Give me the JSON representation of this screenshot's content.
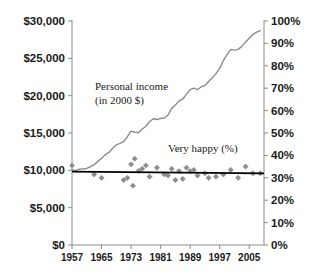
{
  "chart_data": {
    "type": "line",
    "title": "",
    "subtitle": "",
    "xlabel": "",
    "ylabel": "",
    "grid": false,
    "legend_position": "inline-annotations",
    "x": [
      1957,
      1958,
      1959,
      1960,
      1961,
      1962,
      1963,
      1964,
      1965,
      1966,
      1967,
      1968,
      1969,
      1970,
      1971,
      1972,
      1973,
      1974,
      1975,
      1976,
      1977,
      1978,
      1979,
      1980,
      1981,
      1982,
      1983,
      1984,
      1985,
      1986,
      1987,
      1988,
      1989,
      1990,
      1991,
      1992,
      1993,
      1994,
      1995,
      1996,
      1997,
      1998,
      1999,
      2000,
      2001,
      2002,
      2003,
      2004,
      2005,
      2006,
      2007,
      2008
    ],
    "xlim": [
      1957,
      2009
    ],
    "xticks": [
      1957,
      1965,
      1973,
      1981,
      1989,
      1997,
      2005
    ],
    "xticklabels": [
      "1957",
      "1965",
      "1973",
      "1981",
      "1989",
      "1997",
      "2005"
    ],
    "axes": [
      {
        "id": "left",
        "name": "personal-income-axis",
        "ylim": [
          0,
          30000
        ],
        "yticks": [
          0,
          5000,
          10000,
          15000,
          20000,
          25000,
          30000
        ],
        "yticklabels": [
          "$0",
          "$5,000",
          "$10,000",
          "$15,000",
          "$20,000",
          "$25,000",
          "$30,000"
        ]
      },
      {
        "id": "right",
        "name": "very-happy-axis",
        "ylim": [
          0,
          100
        ],
        "yticks": [
          0,
          10,
          20,
          30,
          40,
          50,
          60,
          70,
          80,
          90,
          100
        ],
        "yticklabels": [
          "0%",
          "10%",
          "20%",
          "30%",
          "40%",
          "50%",
          "60%",
          "70%",
          "80%",
          "90%",
          "100%"
        ]
      }
    ],
    "series": [
      {
        "name": "Personal income (in 2000 $)",
        "axis": "left",
        "type": "line",
        "color": "#8c8c8c",
        "values": [
          10100,
          9950,
          10150,
          10200,
          10250,
          10500,
          10750,
          11200,
          11600,
          12100,
          12400,
          12950,
          13400,
          13600,
          13850,
          14500,
          15250,
          15100,
          15050,
          15500,
          15900,
          16500,
          16900,
          16800,
          16950,
          17000,
          17400,
          18300,
          18750,
          19300,
          19550,
          20200,
          20800,
          21000,
          20800,
          21200,
          21350,
          21900,
          22400,
          22950,
          23650,
          24700,
          25500,
          26200,
          26100,
          26200,
          26600,
          27200,
          27700,
          28200,
          28500,
          28700
        ]
      },
      {
        "name": "Very happy (%)",
        "axis": "right",
        "type": "scatter",
        "color": "#8c8c8c",
        "marker": "diamond",
        "points": [
          {
            "x": 1957,
            "y": 35.5
          },
          {
            "x": 1963,
            "y": 31.5
          },
          {
            "x": 1965,
            "y": 30.0
          },
          {
            "x": 1971,
            "y": 29.0
          },
          {
            "x": 1972,
            "y": 30.0
          },
          {
            "x": 1973,
            "y": 36.0
          },
          {
            "x": 1973.5,
            "y": 26.5
          },
          {
            "x": 1974,
            "y": 38.5
          },
          {
            "x": 1975,
            "y": 33.0
          },
          {
            "x": 1976,
            "y": 34.0
          },
          {
            "x": 1977,
            "y": 35.5
          },
          {
            "x": 1978,
            "y": 30.5
          },
          {
            "x": 1980,
            "y": 34.5
          },
          {
            "x": 1982,
            "y": 31.5
          },
          {
            "x": 1983,
            "y": 31.0
          },
          {
            "x": 1984,
            "y": 34.0
          },
          {
            "x": 1985,
            "y": 29.0
          },
          {
            "x": 1986,
            "y": 33.0
          },
          {
            "x": 1987,
            "y": 29.5
          },
          {
            "x": 1988,
            "y": 34.5
          },
          {
            "x": 1989,
            "y": 33.0
          },
          {
            "x": 1990,
            "y": 33.5
          },
          {
            "x": 1991,
            "y": 31.0
          },
          {
            "x": 1993,
            "y": 32.0
          },
          {
            "x": 1994,
            "y": 30.0
          },
          {
            "x": 1996,
            "y": 30.5
          },
          {
            "x": 1998,
            "y": 31.5
          },
          {
            "x": 2000,
            "y": 33.5
          },
          {
            "x": 2002,
            "y": 30.0
          },
          {
            "x": 2004,
            "y": 35.0
          },
          {
            "x": 2006,
            "y": 32.0
          },
          {
            "x": 2008,
            "y": 32.0
          }
        ]
      },
      {
        "name": "Very happy trend",
        "axis": "right",
        "type": "trendline",
        "color": "#000000",
        "start": {
          "x": 1957,
          "y": 32.8
        },
        "end": {
          "x": 2009,
          "y": 32.0
        }
      }
    ],
    "annotations": [
      {
        "name": "personal-income-label-line1",
        "text": "Personal income",
        "x": 95,
        "y": 90
      },
      {
        "name": "personal-income-label-line2",
        "text": "(in 2000 $)",
        "x": 95,
        "y": 104
      },
      {
        "name": "very-happy-label",
        "text": "Very happy (%)",
        "x": 168,
        "y": 152
      }
    ],
    "colors": {
      "income_line": "#8c8c8c",
      "happy_marker": "#8c8c8c",
      "trend_line": "#000000",
      "axis": "#8c8c8c",
      "text": "#1a1a1a",
      "background": "#ffffff"
    }
  }
}
